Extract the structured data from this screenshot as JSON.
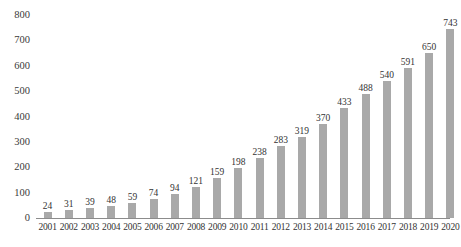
{
  "chart_data": {
    "type": "bar",
    "title": "",
    "subtitle": "",
    "xlabel": "",
    "ylabel": "",
    "categories": [
      "2001",
      "2002",
      "2003",
      "2004",
      "2005",
      "2006",
      "2007",
      "2008",
      "2009",
      "2010",
      "2011",
      "2012",
      "2013",
      "2014",
      "2015",
      "2016",
      "2017",
      "2018",
      "2019",
      "2020"
    ],
    "values": [
      24,
      31,
      39,
      48,
      59,
      74,
      94,
      121,
      159,
      198,
      238,
      283,
      319,
      370,
      433,
      488,
      540,
      591,
      650,
      743
    ],
    "data_labels": [
      "24",
      "31",
      "39",
      "48",
      "59",
      "74",
      "94",
      "121",
      "159",
      "198",
      "238",
      "283",
      "319",
      "370",
      "433",
      "488",
      "540",
      "591",
      "650",
      "743"
    ],
    "ylim": [
      0,
      800
    ],
    "y_ticks": [
      800,
      700,
      600,
      500,
      400,
      300,
      200,
      100,
      0
    ],
    "y_tick_labels": [
      "800",
      "700",
      "600",
      "500",
      "400",
      "300",
      "200",
      "100",
      "0"
    ],
    "grid": false,
    "legend": null,
    "legend_position": "none",
    "series": [
      {
        "name": "",
        "values": [
          24,
          31,
          39,
          48,
          59,
          74,
          94,
          121,
          159,
          198,
          238,
          283,
          319,
          370,
          433,
          488,
          540,
          591,
          650,
          743
        ]
      }
    ],
    "colors": {
      "bar_fill": "#a9a9a9",
      "axis_line": "#8c8c8c",
      "text": "#333333",
      "background": "#ffffff"
    }
  }
}
